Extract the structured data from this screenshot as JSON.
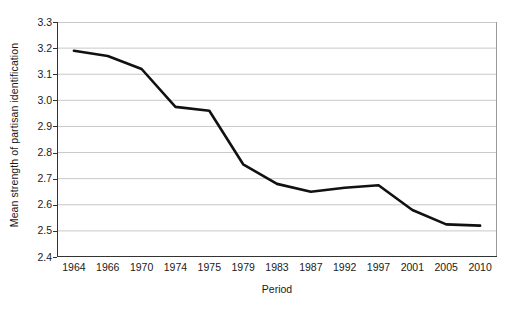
{
  "chart_data": {
    "type": "line",
    "title": "",
    "xlabel": "Period",
    "ylabel": "Mean strength of partisan identification",
    "categories": [
      "1964",
      "1966",
      "1970",
      "1974",
      "1975",
      "1979",
      "1983",
      "1987",
      "1992",
      "1997",
      "2001",
      "2005",
      "2010"
    ],
    "values": [
      3.19,
      3.17,
      3.12,
      2.975,
      2.96,
      2.755,
      2.68,
      2.65,
      2.665,
      2.675,
      2.58,
      2.525,
      2.52
    ],
    "ylim": [
      2.4,
      3.3
    ],
    "ytick_labels": [
      "3.3",
      "3.2",
      "3.1",
      "3.0",
      "2.9",
      "2.8",
      "2.7",
      "2.6",
      "2.5",
      "2.4"
    ],
    "ytick_values": [
      3.3,
      3.2,
      3.1,
      3.0,
      2.9,
      2.8,
      2.7,
      2.6,
      2.5,
      2.4
    ],
    "ystep": 0.1,
    "grid": true,
    "legend": false,
    "line_color": "#111111",
    "grid_color": "#c8c8c8",
    "frame_color": "#9a9a9a"
  }
}
